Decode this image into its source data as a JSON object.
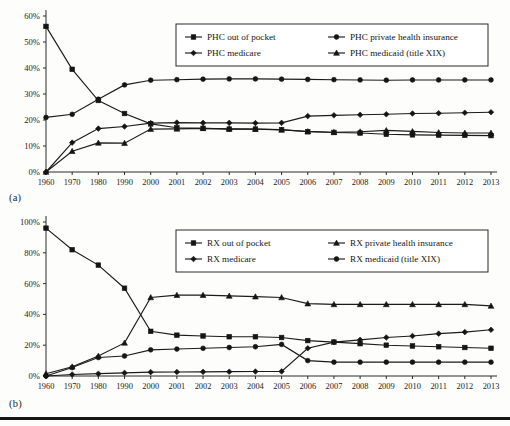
{
  "figure": {
    "panel_a_label": "(a)",
    "panel_b_label": "(b)"
  },
  "chart_data": [
    {
      "type": "line",
      "panel": "(a)",
      "title": "",
      "xlabel": "",
      "ylabel": "",
      "ylim": [
        0,
        60
      ],
      "ytick_labels": [
        "0%",
        "10%",
        "20%",
        "30%",
        "40%",
        "50%",
        "60%"
      ],
      "ytick_values": [
        0,
        10,
        20,
        30,
        40,
        50,
        60
      ],
      "grid": false,
      "legend_position": "upper-right",
      "categories": [
        "1960",
        "1970",
        "1980",
        "1990",
        "2000",
        "2001",
        "2002",
        "2003",
        "2004",
        "2005",
        "2006",
        "2007",
        "2008",
        "2009",
        "2010",
        "2011",
        "2012",
        "2013"
      ],
      "series": [
        {
          "name": "PHC out of pocket",
          "marker": "square",
          "values": [
            56.0,
            39.5,
            27.5,
            22.5,
            18.5,
            17.0,
            16.8,
            16.5,
            16.5,
            16.3,
            15.5,
            15.2,
            15.0,
            14.5,
            14.3,
            14.2,
            14.1,
            14.0
          ]
        },
        {
          "name": "PHC private health insurance",
          "marker": "circle",
          "values": [
            21.0,
            22.2,
            28.0,
            33.5,
            35.3,
            35.5,
            35.7,
            35.8,
            35.8,
            35.7,
            35.6,
            35.5,
            35.4,
            35.3,
            35.4,
            35.4,
            35.4,
            35.4
          ]
        },
        {
          "name": "PHC medicare",
          "marker": "diamond",
          "values": [
            0.0,
            11.3,
            16.7,
            17.5,
            18.8,
            19.0,
            18.9,
            18.9,
            18.8,
            18.9,
            21.5,
            21.8,
            22.0,
            22.2,
            22.5,
            22.6,
            22.8,
            23.0
          ]
        },
        {
          "name": "PHC medicaid (title XIX)",
          "marker": "triangle",
          "values": [
            0.0,
            8.0,
            11.2,
            11.1,
            16.5,
            16.6,
            16.8,
            16.6,
            16.5,
            16.2,
            15.6,
            15.3,
            15.5,
            16.0,
            15.6,
            15.2,
            15.0,
            15.0
          ]
        }
      ]
    },
    {
      "type": "line",
      "panel": "(b)",
      "title": "",
      "xlabel": "",
      "ylabel": "",
      "ylim": [
        0,
        100
      ],
      "ytick_labels": [
        "0%",
        "20%",
        "40%",
        "60%",
        "80%",
        "100%"
      ],
      "ytick_values": [
        0,
        20,
        40,
        60,
        80,
        100
      ],
      "grid": false,
      "legend_position": "upper-right",
      "categories": [
        "1960",
        "1970",
        "1980",
        "1990",
        "2000",
        "2001",
        "2002",
        "2003",
        "2004",
        "2005",
        "2006",
        "2007",
        "2008",
        "2009",
        "2010",
        "2011",
        "2012",
        "2013"
      ],
      "series": [
        {
          "name": "RX out of pocket",
          "marker": "square",
          "values": [
            96.0,
            82.0,
            72.0,
            57.0,
            29.0,
            26.5,
            26.0,
            25.5,
            25.5,
            25.0,
            23.0,
            22.0,
            21.0,
            20.0,
            19.5,
            19.0,
            18.5,
            18.0
          ]
        },
        {
          "name": "RX private health insurance",
          "marker": "triangle",
          "values": [
            1.5,
            6.0,
            13.0,
            21.5,
            51.0,
            52.5,
            52.5,
            52.0,
            51.5,
            51.0,
            47.0,
            46.5,
            46.5,
            46.5,
            46.5,
            46.5,
            46.5,
            45.5
          ]
        },
        {
          "name": "RX medicare",
          "marker": "diamond",
          "values": [
            0.0,
            1.0,
            1.5,
            2.0,
            2.5,
            2.6,
            2.7,
            2.8,
            2.9,
            3.0,
            18.0,
            22.0,
            23.5,
            25.0,
            26.0,
            27.5,
            28.5,
            30.0
          ]
        },
        {
          "name": "RX medicaid (title XIX)",
          "marker": "circle",
          "values": [
            0.0,
            5.5,
            12.0,
            13.0,
            17.0,
            17.5,
            18.0,
            18.5,
            19.0,
            20.5,
            10.0,
            9.0,
            9.0,
            9.0,
            9.0,
            9.0,
            9.0,
            9.0
          ]
        }
      ]
    }
  ]
}
